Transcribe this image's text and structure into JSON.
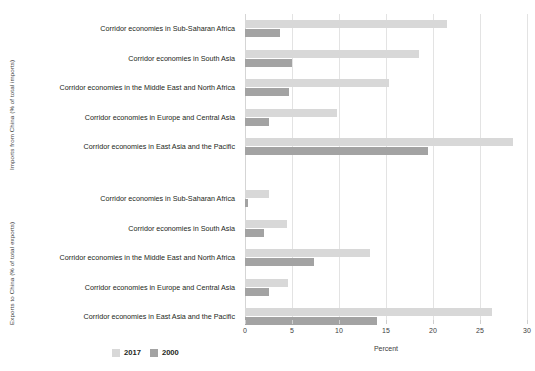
{
  "chart_data": {
    "type": "bar",
    "orientation": "horizontal",
    "title": "",
    "xlabel": "Percent",
    "ylabel": "",
    "xlim": [
      0,
      30
    ],
    "xticks": [
      0,
      5,
      10,
      15,
      20,
      25,
      30
    ],
    "xtick_labels": [
      "0",
      "5",
      "10",
      "15",
      "20",
      "25",
      "30"
    ],
    "grid": true,
    "legend": {
      "position": "bottom-left",
      "entries": [
        {
          "name": "2017",
          "color": "#d8d8d8"
        },
        {
          "name": "2000",
          "color": "#a3a3a3"
        }
      ]
    },
    "panels": [
      {
        "group_label": "Imports from China (% of total imports)",
        "categories": [
          "Corridor economies in Sub-Saharan Africa",
          "Corridor economies in South Asia",
          "Corridor economies in the Middle East and North Africa",
          "Corridor economies in Europe and Central Asia",
          "Corridor economies in East Asia and the Pacific"
        ],
        "series": [
          {
            "name": "2017",
            "values": [
              21.5,
              18.5,
              15.3,
              9.8,
              28.5
            ]
          },
          {
            "name": "2000",
            "values": [
              3.7,
              5.0,
              4.7,
              2.5,
              19.5
            ]
          }
        ]
      },
      {
        "group_label": "Exports to China (% of total exports)",
        "categories": [
          "Corridor economies in Sub-Saharan Africa",
          "Corridor economies in South Asia",
          "Corridor economies in the Middle East and North Africa",
          "Corridor economies in Europe and Central Asia",
          "Corridor economies in East Asia and the Pacific"
        ],
        "series": [
          {
            "name": "2017",
            "values": [
              2.6,
              4.5,
              13.3,
              4.6,
              26.3
            ]
          },
          {
            "name": "2000",
            "values": [
              0.35,
              2.0,
              7.3,
              2.6,
              14.0
            ]
          }
        ]
      }
    ]
  },
  "colors": {
    "series_2017": "#d8d8d8",
    "series_2000": "#a3a3a3",
    "gridline": "#e3e3e3",
    "text": "#231f20",
    "background": "#ffffff"
  }
}
